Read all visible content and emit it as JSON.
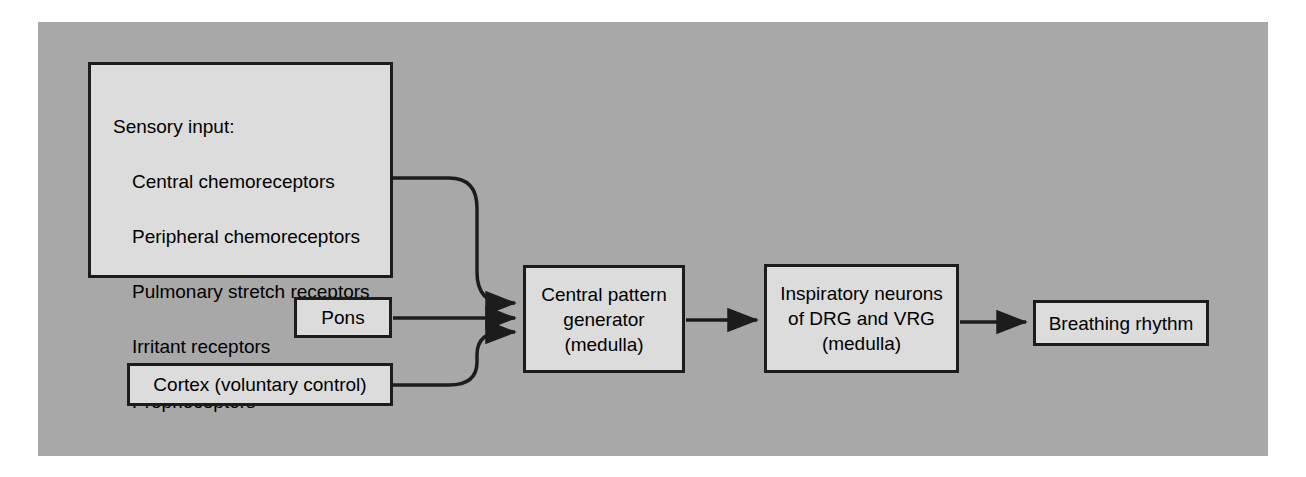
{
  "figure": {
    "panel_background_color": "#a8a8a8",
    "page_background_color": "#ffffff",
    "box_fill_color": "#dcdcdc",
    "box_border_color": "#1c1c1c",
    "text_color": "#000000"
  },
  "nodes": {
    "sensory": {
      "heading": "Sensory input:",
      "items": [
        "Central chemoreceptors",
        "Peripheral chemoreceptors",
        "Pulmonary stretch receptors",
        "Irritant receptors",
        "Proprioceptors"
      ]
    },
    "pons": {
      "label": "Pons"
    },
    "cortex": {
      "label": "Cortex  (voluntary control)"
    },
    "cpg": {
      "label": "Central pattern\ngenerator\n(medulla)"
    },
    "drg": {
      "label": "Inspiratory neurons\nof DRG and VRG\n(medulla)"
    },
    "breathing": {
      "label": "Breathing rhythm"
    }
  },
  "edges": [
    {
      "from": "sensory",
      "to": "cpg",
      "style": "curved"
    },
    {
      "from": "pons",
      "to": "cpg",
      "style": "straight"
    },
    {
      "from": "cortex",
      "to": "cpg",
      "style": "curved"
    },
    {
      "from": "cpg",
      "to": "drg",
      "style": "straight"
    },
    {
      "from": "drg",
      "to": "breathing",
      "style": "straight"
    }
  ]
}
